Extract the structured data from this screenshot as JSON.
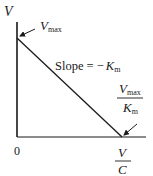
{
  "diagram": {
    "type": "Eadie-Hofstee plot",
    "y_axis_label": "V",
    "x_axis_label": {
      "numerator": "V",
      "denominator": "C"
    },
    "origin_label": "0",
    "y_intercept_label": {
      "main": "V",
      "sub": "max"
    },
    "x_intercept_label": {
      "numerator": {
        "main": "V",
        "sub": "max"
      },
      "denominator": {
        "main": "K",
        "sub": "m"
      }
    },
    "slope_label": {
      "prefix": "Slope = −",
      "main": "K",
      "sub": "m"
    },
    "line_color": "#1a1a1a",
    "background": "#ffffff"
  }
}
